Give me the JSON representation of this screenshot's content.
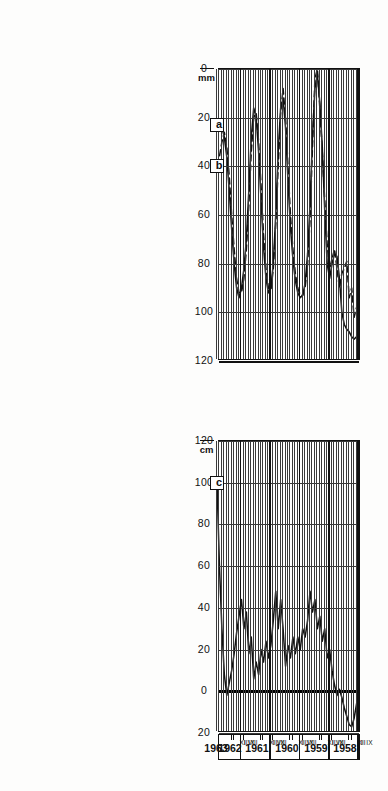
{
  "figure": {
    "orientation": "rotated-90",
    "background": "#fdfdfc",
    "ink": "#111111"
  },
  "panels": {
    "top": {
      "unit_label": "mm",
      "curve_labels": [
        "a",
        "b"
      ],
      "axis_ticks": [
        "120",
        "100",
        "80",
        "60",
        "40",
        "20",
        "0"
      ]
    },
    "bottom": {
      "unit_label": "cm",
      "curve_labels": [
        "c"
      ],
      "axis_ticks": [
        "20",
        "0",
        "20",
        "40",
        "60",
        "80",
        "100",
        "120"
      ]
    }
  },
  "time_axis": {
    "years": [
      "1958",
      "1959",
      "1960",
      "1961",
      "1962",
      "1963"
    ],
    "month_marks": [
      "IX",
      "XII",
      "I",
      "VIII",
      "IX",
      "XII",
      "I",
      "VIII",
      "IX",
      "XII",
      "I",
      "VIII",
      "IX",
      "XII",
      "I",
      "VIII",
      "IX",
      "XII",
      "I"
    ]
  },
  "chart_data": {
    "type": "line",
    "title": "",
    "xlabel": "",
    "ylabel": "",
    "orientation": "rotated-90",
    "charts": [
      {
        "id": "top",
        "type": "line",
        "ylabel": "mm",
        "ylim": [
          0,
          120
        ],
        "yticks": [
          0,
          20,
          40,
          60,
          80,
          100,
          120
        ],
        "grid": true,
        "xlabel": "",
        "x": [
          "1958-IX",
          "1958-X",
          "1958-XI",
          "1958-XII",
          "1959-I",
          "1959-II",
          "1959-III",
          "1959-IV",
          "1959-V",
          "1959-VI",
          "1959-VII",
          "1959-VIII",
          "1959-IX",
          "1959-X",
          "1959-XI",
          "1959-XII",
          "1960-I",
          "1960-II",
          "1960-III",
          "1960-IV",
          "1960-V",
          "1960-VI",
          "1960-VII",
          "1960-VIII",
          "1960-IX",
          "1960-X",
          "1960-XI",
          "1960-XII",
          "1961-I",
          "1961-II",
          "1961-III",
          "1961-IV",
          "1961-V",
          "1961-VI",
          "1961-VII",
          "1961-VIII",
          "1961-IX",
          "1961-X",
          "1961-XI",
          "1961-XII",
          "1962-I",
          "1962-II",
          "1962-III",
          "1962-IV",
          "1962-V",
          "1962-VI",
          "1962-VII",
          "1962-VIII",
          "1962-IX",
          "1962-X",
          "1962-XI",
          "1962-XII",
          "1963-I",
          "1963-II",
          "1963-III",
          "1963-IV",
          "1963-V",
          "1963-VI",
          "1963-VII"
        ],
        "series": [
          {
            "name": "a",
            "style": "solid",
            "values": [
              14,
              10,
              9,
              10,
              12,
              13,
              15,
              20,
              34,
              43,
              44,
              40,
              34,
              40,
              62,
              88,
              106,
              118,
              112,
              92,
              64,
              44,
              32,
              27,
              26,
              28,
              33,
              42,
              55,
              74,
              96,
              108,
              104,
              86,
              60,
              40,
              30,
              28,
              34,
              47,
              66,
              86,
              100,
              104,
              92,
              70,
              50,
              38,
              30,
              26,
              30,
              40,
              54,
              70,
              84,
              92,
              96,
              98,
              97
            ]
          },
          {
            "name": "b",
            "style": "dashed",
            "values": [
              16,
              22,
              18,
              30,
              26,
              41,
              38,
              36,
              30,
              38,
              46,
              42,
              38,
              48,
              66,
              86,
              104,
              120,
              116,
              88,
              58,
              40,
              30,
              27,
              27,
              30,
              36,
              46,
              60,
              80,
              100,
              112,
              102,
              80,
              56,
              38,
              29,
              30,
              38,
              52,
              72,
              90,
              102,
              100,
              86,
              64,
              46,
              34,
              28,
              28,
              34,
              46,
              60,
              76,
              88,
              94,
              90,
              84,
              80
            ]
          }
        ]
      },
      {
        "id": "bottom",
        "type": "line",
        "ylabel": "cm",
        "ylim": [
          -20,
          120
        ],
        "yticks": [
          -20,
          0,
          20,
          40,
          60,
          80,
          100,
          120
        ],
        "grid": true,
        "xlabel": "",
        "x": [
          "1958-IX",
          "1958-X",
          "1958-XI",
          "1958-XII",
          "1959-I",
          "1959-II",
          "1959-III",
          "1959-IV",
          "1959-V",
          "1959-VI",
          "1959-VII",
          "1959-VIII",
          "1959-IX",
          "1959-X",
          "1959-XI",
          "1959-XII",
          "1960-I",
          "1960-II",
          "1960-III",
          "1960-IV",
          "1960-V",
          "1960-VI",
          "1960-VII",
          "1960-VIII",
          "1960-IX",
          "1960-X",
          "1960-XI",
          "1960-XII",
          "1961-I",
          "1961-II",
          "1961-III",
          "1961-IV",
          "1961-V",
          "1961-VI",
          "1961-VII",
          "1961-VIII",
          "1961-IX",
          "1961-X",
          "1961-XI",
          "1961-XII",
          "1962-I",
          "1962-II",
          "1962-III",
          "1962-IV",
          "1962-V",
          "1962-VI",
          "1962-VII",
          "1962-VIII",
          "1962-IX",
          "1962-X",
          "1962-XI",
          "1962-XII",
          "1963-I",
          "1963-II",
          "1963-III",
          "1963-IV",
          "1963-V",
          "1963-VI",
          "1963-VII"
        ],
        "series": [
          {
            "name": "c",
            "style": "solid",
            "values": [
              0,
              -6,
              -13,
              -17,
              -16,
              -12,
              -8,
              -3,
              1,
              -2,
              3,
              10,
              20,
              16,
              30,
              24,
              36,
              30,
              44,
              38,
              48,
              34,
              26,
              30,
              20,
              26,
              18,
              26,
              16,
              22,
              12,
              30,
              44,
              30,
              48,
              34,
              22,
              16,
              24,
              14,
              20,
              8,
              14,
              6,
              26,
              18,
              38,
              30,
              44,
              36,
              28,
              18,
              10,
              4,
              -2,
              8,
              30,
              60,
              100
            ]
          }
        ]
      }
    ]
  }
}
